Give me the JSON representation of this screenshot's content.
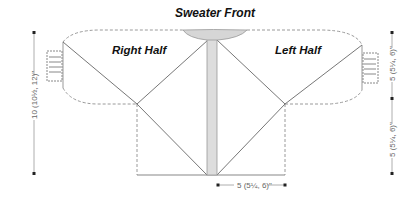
{
  "diagram": {
    "title": "Sweater Front",
    "panels": {
      "right_half": {
        "label": "Right Half"
      },
      "left_half": {
        "label": "Left Half"
      }
    },
    "dimensions": {
      "left_height": "10 (10½, 12)\"",
      "right_upper": "5 (5¼, 6)\"",
      "right_lower": "5 (5¼, 6)\"",
      "bottom_width": "5 (5¼, 6)\""
    },
    "colors": {
      "outline": "#999999",
      "dashed": "#aaaaaa",
      "diagonal": "#777777",
      "button_band_fill": "#dddddd",
      "collar_fill": "#d6d6d6",
      "text": "#111111",
      "dim_text": "#666666"
    }
  }
}
